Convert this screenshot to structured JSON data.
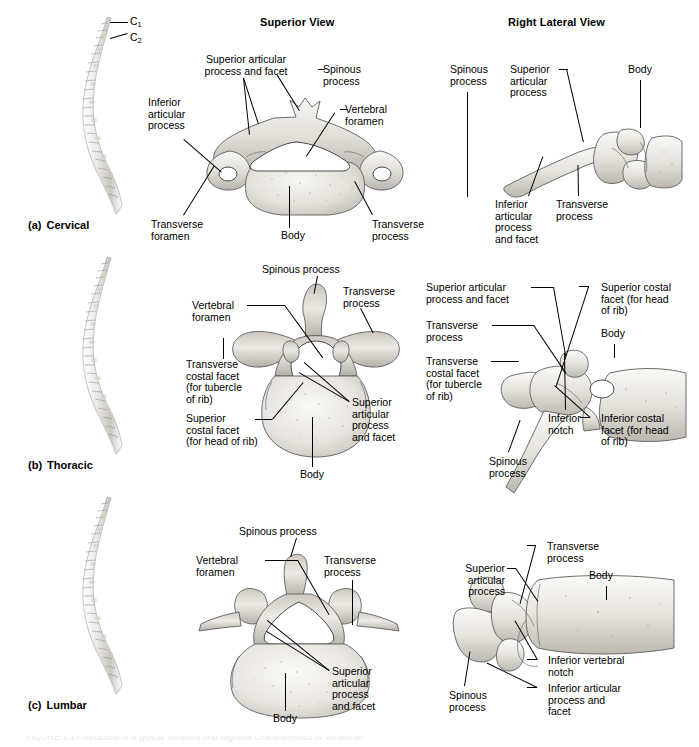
{
  "figure": {
    "title": "Regional characteristics of vertebrae",
    "columns": [
      {
        "id": "spine",
        "label": ""
      },
      {
        "id": "superior",
        "label": "Superior View"
      },
      {
        "id": "lateral",
        "label": "Right Lateral View"
      }
    ],
    "rows": [
      {
        "id": "cervical",
        "letter": "(a)",
        "name": "Cervical"
      },
      {
        "id": "thoracic",
        "letter": "(b)",
        "name": "Thoracic"
      },
      {
        "id": "lumbar",
        "letter": "(c)",
        "name": "Lumbar"
      }
    ],
    "spine_markers": {
      "c1": "C",
      "c1_sub": "1",
      "c2": "C",
      "c2_sub": "2"
    },
    "caption": "FIGURE 7.17  Structure of a typical vertebra and regional characteristics of vertebrae."
  },
  "labels": {
    "cervical_superior": {
      "superior_articular": "Superior articular\nprocess and facet",
      "inferior_articular": "Inferior\narticular\nprocess",
      "spinous": "Spinous\nprocess",
      "vertebral_foramen": "Vertebral\nforamen",
      "transverse_foramen": "Transverse\nforamen",
      "body": "Body",
      "transverse_process": "Transverse\nprocess"
    },
    "cervical_lateral": {
      "spinous": "Spinous\nprocess",
      "superior_articular": "Superior\narticular\nprocess",
      "body": "Body",
      "inferior_articular": "Inferior\narticular\nprocess\nand facet",
      "transverse_process": "Transverse\nprocess"
    },
    "thoracic_superior": {
      "spinous": "Spinous process",
      "transverse_process": "Transverse\nprocess",
      "vertebral_foramen": "Vertebral\nforamen",
      "transverse_costal_facet": "Transverse\ncostal facet\n(for tubercle\nof rib)",
      "superior_costal_facet": "Superior\ncostal facet\n(for head of rib)",
      "superior_articular": "Superior\narticular\nprocess\nand facet",
      "body": "Body"
    },
    "thoracic_lateral": {
      "superior_articular": "Superior articular\nprocess and facet",
      "transverse_process": "Transverse\nprocess",
      "transverse_costal_facet": "Transverse\ncostal facet\n(for tubercle\nof rib)",
      "superior_costal_facet": "Superior costal\nfacet (for head\nof rib)",
      "body": "Body",
      "inferior_notch": "Inferior\nnotch",
      "inferior_costal_facet": "Inferior costal\nfacet (for head\nof rib)",
      "spinous": "Spinous\nprocess"
    },
    "lumbar_superior": {
      "spinous": "Spinous process",
      "vertebral_foramen": "Vertebral\nforamen",
      "transverse_process": "Transverse\nprocess",
      "superior_articular": "Superior\narticular\nprocess\nand facet",
      "body": "Body"
    },
    "lumbar_lateral": {
      "superior_articular": "Superior\narticular\nprocess",
      "transverse_process": "Transverse\nprocess",
      "body": "Body",
      "inferior_vertebral_notch": "Inferior vertebral\nnotch",
      "inferior_articular": "Inferior articular\nprocess and\nfacet",
      "spinous": "Spinous\nprocess"
    }
  },
  "colors": {
    "background": "#ffffff",
    "text": "#000000",
    "leader_line": "#000000",
    "bone_light": "#f4f2ee",
    "bone_mid": "#d8d4cd",
    "bone_shadow": "#a9a49b",
    "bone_outline": "#5d5d5d"
  }
}
